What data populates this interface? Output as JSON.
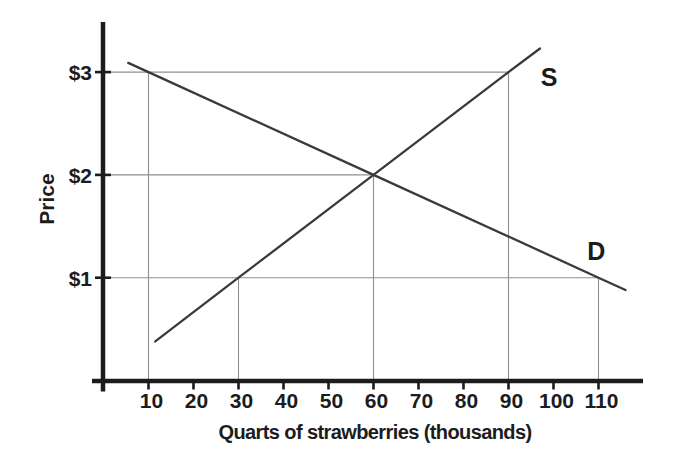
{
  "figure": {
    "background": "#ffffff",
    "ink_color": "#1c1c1c",
    "grid_color": "#8f8f8f",
    "curve_color": "#3a3a3a"
  },
  "chart_data": {
    "type": "line",
    "title": "",
    "xlabel": "Quarts of strawberries (thousands)",
    "ylabel": "Price",
    "x_ticks": [
      10,
      20,
      30,
      40,
      50,
      60,
      70,
      80,
      90,
      100,
      110
    ],
    "y_ticks": [
      {
        "value": 1,
        "label": "$1"
      },
      {
        "value": 2,
        "label": "$2"
      },
      {
        "value": 3,
        "label": "$3"
      }
    ],
    "xlim": [
      0,
      120
    ],
    "ylim": [
      0,
      3.5
    ],
    "grid": "reference lines at landmark points only",
    "legend": "inline curve labels",
    "series": [
      {
        "name": "supply",
        "label": "S",
        "points": [
          [
            11.5,
            0.38
          ],
          [
            30,
            1
          ],
          [
            60,
            2
          ],
          [
            90,
            3
          ],
          [
            97,
            3.23
          ]
        ],
        "label_at": [
          99,
          2.95
        ]
      },
      {
        "name": "demand",
        "label": "D",
        "points": [
          [
            5.5,
            3.09
          ],
          [
            10,
            3
          ],
          [
            60,
            2
          ],
          [
            110,
            1
          ],
          [
            116,
            0.88
          ]
        ],
        "label_at": [
          109.5,
          1.26
        ]
      }
    ],
    "reference_lines": {
      "horizontal": [
        {
          "price": 3,
          "from_quantity": 0,
          "to_quantity": 90
        },
        {
          "price": 2,
          "from_quantity": 0,
          "to_quantity": 60
        },
        {
          "price": 1,
          "from_quantity": 0,
          "to_quantity": 110
        }
      ],
      "vertical": [
        {
          "quantity": 10,
          "from_price": 0,
          "to_price": 3
        },
        {
          "quantity": 30,
          "from_price": 0,
          "to_price": 1
        },
        {
          "quantity": 60,
          "from_price": 0,
          "to_price": 2
        },
        {
          "quantity": 90,
          "from_price": 0,
          "to_price": 3
        },
        {
          "quantity": 110,
          "from_price": 0,
          "to_price": 1
        }
      ]
    },
    "equilibrium": {
      "quantity": 60,
      "price": 2
    }
  }
}
